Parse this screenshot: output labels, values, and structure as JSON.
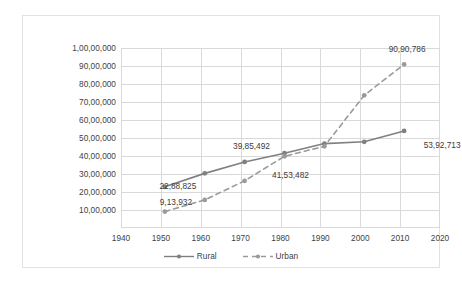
{
  "chart_data": {
    "type": "line",
    "title": "",
    "xlabel": "",
    "ylabel": "",
    "xlim": [
      1940,
      2020
    ],
    "ylim": [
      0,
      10000000
    ],
    "grid": true,
    "legend_position": "bottom",
    "xticks": [
      "1940",
      "1950",
      "1960",
      "1970",
      "1980",
      "1990",
      "2000",
      "2010",
      "2020"
    ],
    "xtick_values": [
      1940,
      1950,
      1960,
      1970,
      1980,
      1990,
      2000,
      2010,
      2020
    ],
    "yticks": [
      "10,00,000",
      "20,00,000",
      "30,00,000",
      "40,00,000",
      "50,00,000",
      "60,00,000",
      "70,00,000",
      "80,00,000",
      "90,00,000",
      "1,00,00,000"
    ],
    "ytick_values": [
      1000000,
      2000000,
      3000000,
      4000000,
      5000000,
      6000000,
      7000000,
      8000000,
      9000000,
      10000000
    ],
    "x": [
      1951,
      1961,
      1971,
      1981,
      1991,
      2001,
      2011
    ],
    "series": [
      {
        "name": "Rural",
        "style": "solid",
        "color": "#808080",
        "values": [
          2288825,
          3035000,
          3670000,
          4153482,
          4690000,
          4790000,
          5392713
        ]
      },
      {
        "name": "Urban",
        "style": "dashed",
        "color": "#9a9a9a",
        "values": [
          913932,
          1560000,
          2620000,
          3985492,
          4540000,
          7370000,
          9090786
        ]
      }
    ],
    "annotations": [
      {
        "text": "9,13,932",
        "series": "Urban",
        "x": 1951,
        "y": 913932
      },
      {
        "text": "22,88,825",
        "series": "Rural",
        "x": 1951,
        "y": 2288825
      },
      {
        "text": "39,85,492",
        "series": "Urban",
        "x": 1981,
        "y": 3985492
      },
      {
        "text": "41,53,482",
        "series": "Rural",
        "x": 1981,
        "y": 4153482
      },
      {
        "text": "90,90,786",
        "series": "Urban",
        "x": 2011,
        "y": 9090786
      },
      {
        "text": "53,92,713",
        "series": "Rural",
        "x": 2011,
        "y": 5392713
      }
    ]
  },
  "legend": {
    "items": [
      {
        "label": "Rural",
        "style": "solid"
      },
      {
        "label": "Urban",
        "style": "dashed"
      }
    ]
  }
}
